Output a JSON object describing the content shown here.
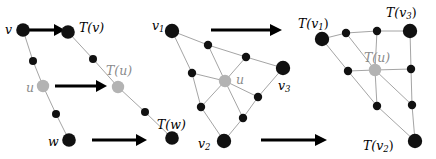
{
  "figure": {
    "width": 436,
    "height": 159,
    "background": "#ffffff",
    "colors": {
      "node_black": "#111111",
      "node_gray": "#b3b3b3",
      "edge_gray": "#9a9a9a",
      "arrow_black": "#000000",
      "label_black": "#000000",
      "label_gray": "#8a8a8a"
    }
  },
  "panels": {
    "left": {
      "name": "edge-subdivision-chain",
      "labels": {
        "v": "v",
        "u": "u",
        "w": "w",
        "Tv": "T(v)",
        "Tu": "T(u)",
        "Tw": "T(w)"
      }
    },
    "middle": {
      "name": "triangle-mesh-before",
      "labels": {
        "v1": "v",
        "v1_sub": "1",
        "v2": "v",
        "v2_sub": "2",
        "v3": "v",
        "v3_sub": "3",
        "u": "u"
      }
    },
    "right": {
      "name": "triangle-mesh-after",
      "labels": {
        "Tv1": "T(v",
        "Tv1_sub": "1",
        "Tv1_end": ")",
        "Tv2": "T(v",
        "Tv2_sub": "2",
        "Tv2_end": ")",
        "Tv3": "T(v",
        "Tv3_sub": "3",
        "Tv3_end": ")",
        "Tu": "T(u)"
      }
    }
  },
  "arrows": [
    {
      "name": "arrow-v-to-Tv",
      "x1": 28,
      "y1": 30,
      "x2": 63,
      "y2": 30
    },
    {
      "name": "arrow-u-to-Tu",
      "x1": 55,
      "y1": 86,
      "x2": 106,
      "y2": 86
    },
    {
      "name": "arrow-w-to-Tw",
      "x1": 92,
      "y1": 140,
      "x2": 146,
      "y2": 140
    },
    {
      "name": "arrow-mesh-top",
      "x1": 211,
      "y1": 30,
      "x2": 281,
      "y2": 30
    },
    {
      "name": "arrow-mesh-bottom",
      "x1": 261,
      "y1": 140,
      "x2": 326,
      "y2": 140
    }
  ],
  "nodes": {
    "left_chain_a": [
      {
        "name": "node-v",
        "x": 23,
        "y": 30,
        "r": 6.8,
        "kind": "black"
      },
      {
        "name": "node-mid-v-u",
        "x": 33,
        "y": 61,
        "r": 4.0,
        "kind": "black"
      },
      {
        "name": "node-u",
        "x": 43,
        "y": 86,
        "r": 6.2,
        "kind": "gray"
      },
      {
        "name": "node-mid-u-w",
        "x": 56,
        "y": 114,
        "r": 4.0,
        "kind": "black"
      },
      {
        "name": "node-w",
        "x": 69,
        "y": 140,
        "r": 6.8,
        "kind": "black"
      }
    ],
    "left_chain_b": [
      {
        "name": "node-Tv",
        "x": 68,
        "y": 32,
        "r": 6.8,
        "kind": "black"
      },
      {
        "name": "node-mid-Tv-Tu",
        "x": 93,
        "y": 59,
        "r": 4.0,
        "kind": "black"
      },
      {
        "name": "node-Tu",
        "x": 118,
        "y": 87,
        "r": 6.2,
        "kind": "gray"
      },
      {
        "name": "node-mid-Tu-Tw",
        "x": 145,
        "y": 112,
        "r": 4.0,
        "kind": "black"
      },
      {
        "name": "node-Tw",
        "x": 172,
        "y": 138,
        "r": 6.8,
        "kind": "black"
      }
    ],
    "middle_mesh": [
      {
        "name": "node-v1",
        "x": 172,
        "y": 31,
        "r": 7.2,
        "kind": "black"
      },
      {
        "name": "node-v3",
        "x": 283,
        "y": 68,
        "r": 7.2,
        "kind": "black"
      },
      {
        "name": "node-v2",
        "x": 224,
        "y": 141,
        "r": 7.2,
        "kind": "black"
      },
      {
        "name": "node-u-center",
        "x": 225,
        "y": 81,
        "r": 6.2,
        "kind": "gray"
      },
      {
        "name": "node-mid-1",
        "x": 208,
        "y": 45,
        "r": 4.2,
        "kind": "black"
      },
      {
        "name": "node-mid-2",
        "x": 246,
        "y": 57,
        "r": 4.2,
        "kind": "black"
      },
      {
        "name": "node-mid-3",
        "x": 192,
        "y": 73,
        "r": 4.2,
        "kind": "black"
      },
      {
        "name": "node-mid-4",
        "x": 258,
        "y": 97,
        "r": 4.2,
        "kind": "black"
      },
      {
        "name": "node-mid-5",
        "x": 201,
        "y": 107,
        "r": 4.2,
        "kind": "black"
      },
      {
        "name": "node-mid-6",
        "x": 243,
        "y": 118,
        "r": 4.2,
        "kind": "black"
      }
    ],
    "right_mesh": [
      {
        "name": "node-Tv1",
        "x": 322,
        "y": 39,
        "r": 7.2,
        "kind": "black"
      },
      {
        "name": "node-Tv3",
        "x": 410,
        "y": 31,
        "r": 7.2,
        "kind": "black"
      },
      {
        "name": "node-Tv2",
        "x": 415,
        "y": 141,
        "r": 7.2,
        "kind": "black"
      },
      {
        "name": "node-Tu-center",
        "x": 375,
        "y": 70,
        "r": 6.2,
        "kind": "gray"
      },
      {
        "name": "node-rmid-1",
        "x": 346,
        "y": 33,
        "r": 4.2,
        "kind": "black"
      },
      {
        "name": "node-rmid-2",
        "x": 377,
        "y": 31,
        "r": 4.2,
        "kind": "black"
      },
      {
        "name": "node-rmid-3",
        "x": 348,
        "y": 71,
        "r": 4.2,
        "kind": "black"
      },
      {
        "name": "node-rmid-4",
        "x": 411,
        "y": 69,
        "r": 4.2,
        "kind": "black"
      },
      {
        "name": "node-rmid-5",
        "x": 377,
        "y": 106,
        "r": 4.2,
        "kind": "black"
      },
      {
        "name": "node-rmid-6",
        "x": 412,
        "y": 105,
        "r": 4.2,
        "kind": "black"
      }
    ]
  },
  "edges": {
    "left_chain_a": [
      [
        23,
        30,
        33,
        61
      ],
      [
        33,
        61,
        43,
        86
      ],
      [
        43,
        86,
        56,
        114
      ],
      [
        56,
        114,
        69,
        140
      ]
    ],
    "left_chain_b": [
      [
        68,
        32,
        93,
        59
      ],
      [
        93,
        59,
        118,
        87
      ],
      [
        118,
        87,
        145,
        112
      ],
      [
        145,
        112,
        172,
        138
      ]
    ],
    "middle_mesh": [
      [
        172,
        31,
        208,
        45
      ],
      [
        208,
        45,
        246,
        57
      ],
      [
        246,
        57,
        283,
        68
      ],
      [
        172,
        31,
        192,
        73
      ],
      [
        192,
        73,
        201,
        107
      ],
      [
        201,
        107,
        224,
        141
      ],
      [
        283,
        68,
        258,
        97
      ],
      [
        258,
        97,
        243,
        118
      ],
      [
        243,
        118,
        224,
        141
      ],
      [
        208,
        45,
        225,
        81
      ],
      [
        246,
        57,
        225,
        81
      ],
      [
        192,
        73,
        225,
        81
      ],
      [
        258,
        97,
        225,
        81
      ],
      [
        201,
        107,
        225,
        81
      ],
      [
        243,
        118,
        225,
        81
      ]
    ],
    "right_mesh": [
      [
        322,
        39,
        346,
        33
      ],
      [
        346,
        33,
        377,
        31
      ],
      [
        377,
        31,
        410,
        31
      ],
      [
        322,
        39,
        348,
        71
      ],
      [
        348,
        71,
        377,
        106
      ],
      [
        377,
        106,
        415,
        141
      ],
      [
        410,
        31,
        411,
        69
      ],
      [
        411,
        69,
        412,
        105
      ],
      [
        412,
        105,
        415,
        141
      ],
      [
        346,
        33,
        375,
        70
      ],
      [
        377,
        31,
        375,
        70
      ],
      [
        348,
        71,
        375,
        70
      ],
      [
        411,
        69,
        375,
        70
      ],
      [
        377,
        106,
        375,
        70
      ],
      [
        412,
        105,
        375,
        70
      ]
    ]
  }
}
